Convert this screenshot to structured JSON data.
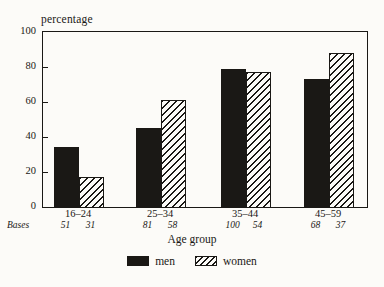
{
  "chart_data": {
    "type": "bar",
    "title": "percentage",
    "xlabel": "Age group",
    "ylabel": "percentage",
    "ylim": [
      0,
      100
    ],
    "yticks": [
      0,
      20,
      40,
      60,
      80,
      100
    ],
    "categories": [
      "16–24",
      "25–34",
      "35–44",
      "45–59"
    ],
    "series": [
      {
        "name": "men",
        "style": "solid-black",
        "values": [
          34,
          45,
          79,
          73
        ],
        "bases": [
          51,
          81,
          100,
          68
        ]
      },
      {
        "name": "women",
        "style": "diagonal-hatch",
        "values": [
          17,
          61,
          77,
          88
        ],
        "bases": [
          31,
          58,
          54,
          37
        ]
      }
    ],
    "bases_label": "Bases",
    "legend": [
      "men",
      "women"
    ],
    "legend_position": "bottom-center",
    "grid": false
  },
  "colors": {
    "ink": "#1a1815",
    "background": "#fcfbf8"
  }
}
